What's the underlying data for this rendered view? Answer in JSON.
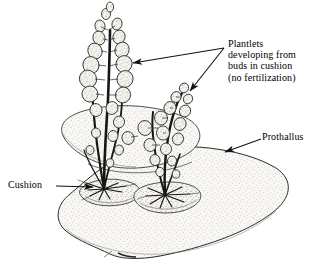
{
  "figure": {
    "subject": "prothallus",
    "background_color": "#ffffff",
    "ink_color": "#1a1a1a",
    "fill_color": "#f7f6f2",
    "stipple_color": "#9a968c"
  },
  "labels": {
    "plantlets": {
      "name": "plantlets-label",
      "lines": [
        "Plantlets",
        "developing from",
        "buds in cushion",
        "(no fertilization)"
      ],
      "text": "Plantlets\ndeveloping from\nbuds in cushion\n(no fertilization)",
      "leader_count": 2
    },
    "prothallus": {
      "name": "prothallus-label",
      "text": "Prothallus",
      "leader_count": 1
    },
    "cushion": {
      "name": "cushion-label",
      "text": "Cushion",
      "leader_count": 1
    }
  },
  "leaders": [
    {
      "name": "leader-plantlets-left",
      "from": [
        224,
        48
      ],
      "to": [
        130,
        63
      ],
      "arrow": true
    },
    {
      "name": "leader-plantlets-right",
      "from": [
        224,
        48
      ],
      "to": [
        188,
        92
      ],
      "arrow": true
    },
    {
      "name": "leader-prothallus",
      "from": [
        261,
        139
      ],
      "to": [
        223,
        153
      ],
      "arrow": true
    },
    {
      "name": "leader-cushion",
      "from": [
        56,
        186
      ],
      "to": [
        95,
        187
      ],
      "arrow": true
    }
  ],
  "anatomy": {
    "prothallus": {
      "name": "prothallus-body",
      "description": "broad kidney-shaped gametophyte thallus, stippled surface, notch at lower margin"
    },
    "upper_lobe": {
      "name": "prothallus-upper-lobe",
      "description": "raised rear lobe of the thallus behind the plantlets"
    },
    "cushions": [
      {
        "name": "cushion-mound-left",
        "description": "thickened meristematic cushion bearing the left plantlet"
      },
      {
        "name": "cushion-mound-right",
        "description": "thickened meristematic cushion bearing the right plantlet"
      }
    ],
    "plantlets": [
      {
        "name": "plantlet-left",
        "description": "tall sporophyte plantlet with pinnate rounded leaflets arising from cushion bud"
      },
      {
        "name": "plantlet-right",
        "description": "shorter sporophyte plantlet with pinnate rounded leaflets arising from cushion bud"
      }
    ],
    "rhizoids": {
      "name": "rhizoid-cluster",
      "description": "dark radiating rhizoids at the base of each plantlet"
    }
  }
}
